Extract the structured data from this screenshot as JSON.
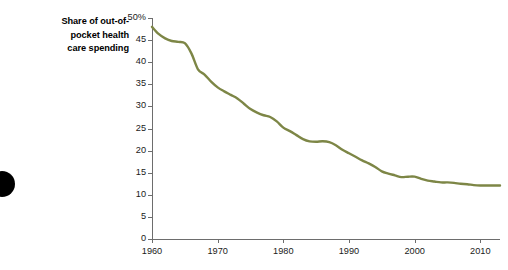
{
  "title": {
    "lines": [
      "Share of out-of-",
      "pocket health",
      "care spending"
    ],
    "full": "Share of out-of-pocket health care spending"
  },
  "axes": {
    "y_ticks": [
      "50%",
      "45",
      "40",
      "35",
      "30",
      "25",
      "20",
      "15",
      "10",
      "5",
      "0"
    ],
    "x_ticks": [
      "1960",
      "1970",
      "1980",
      "1990",
      "2000",
      "2010"
    ]
  },
  "colors": {
    "line": "#7d8646",
    "axis": "#6d6d6d",
    "text": "#1a1a1a",
    "marker": "#000000"
  },
  "chart_data": {
    "type": "line",
    "xlabel": "",
    "ylabel": "",
    "xlim": [
      1960,
      2013
    ],
    "ylim": [
      0,
      50
    ],
    "grid": false,
    "legend": "none",
    "y_tick_values": [
      0,
      5,
      10,
      15,
      20,
      25,
      30,
      35,
      40,
      45,
      50
    ],
    "y_tick_labels": [
      "0",
      "5",
      "10",
      "15",
      "20",
      "25",
      "30",
      "35",
      "40",
      "45",
      "50%"
    ],
    "x_tick_values": [
      1960,
      1970,
      1980,
      1990,
      2000,
      2010
    ],
    "x_tick_labels": [
      "1960",
      "1970",
      "1980",
      "1990",
      "2000",
      "2010"
    ],
    "series": [
      {
        "name": "Out-of-pocket share",
        "color": "#7d8646",
        "x": [
          1960,
          1961,
          1962,
          1963,
          1964,
          1965,
          1966,
          1967,
          1968,
          1969,
          1970,
          1971,
          1972,
          1973,
          1974,
          1975,
          1976,
          1977,
          1978,
          1979,
          1980,
          1981,
          1982,
          1983,
          1984,
          1985,
          1986,
          1987,
          1988,
          1989,
          1990,
          1991,
          1992,
          1993,
          1994,
          1995,
          1996,
          1997,
          1998,
          1999,
          2000,
          2001,
          2002,
          2003,
          2004,
          2005,
          2006,
          2007,
          2008,
          2009,
          2010,
          2011,
          2012,
          2013
        ],
        "values": [
          48.0,
          46.4,
          45.4,
          44.8,
          44.6,
          44.3,
          42.0,
          38.4,
          37.2,
          35.6,
          34.3,
          33.4,
          32.6,
          31.8,
          30.6,
          29.4,
          28.6,
          28.0,
          27.6,
          26.6,
          25.2,
          24.4,
          23.5,
          22.6,
          22.1,
          22.0,
          22.1,
          21.9,
          21.2,
          20.2,
          19.4,
          18.6,
          17.8,
          17.1,
          16.3,
          15.3,
          14.8,
          14.4,
          14.0,
          14.1,
          14.1,
          13.6,
          13.2,
          13.0,
          12.8,
          12.8,
          12.7,
          12.5,
          12.4,
          12.2,
          12.1,
          12.1,
          12.1,
          12.1
        ]
      }
    ]
  }
}
